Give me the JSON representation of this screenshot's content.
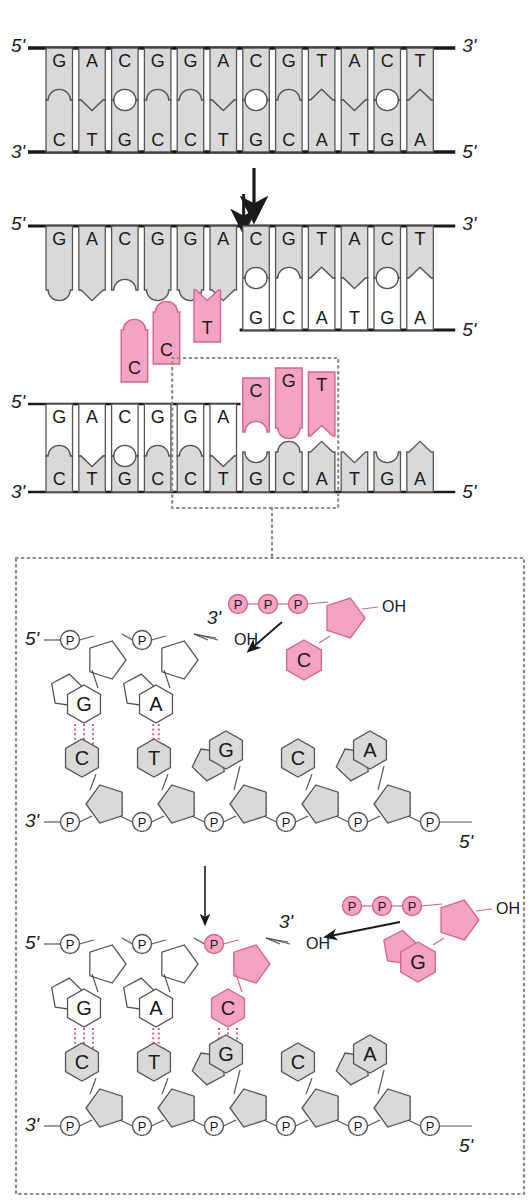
{
  "figure": {
    "colors": {
      "grey_fill": "#d9d9d9",
      "grey_stroke": "#555555",
      "pink_fill": "#f5a3c2",
      "pink_stroke": "#d4648f",
      "white_fill": "#ffffff",
      "line": "#1a1a1a",
      "hbond": "#e2578c"
    }
  },
  "panel1": {
    "name": "intact-double-helix",
    "end_labels": {
      "left_top": "5'",
      "right_top": "3'",
      "left_bottom": "3'",
      "right_bottom": "5'"
    },
    "top_strand": [
      "G",
      "A",
      "C",
      "G",
      "G",
      "A",
      "C",
      "G",
      "T",
      "A",
      "C",
      "T"
    ],
    "bottom_strand": [
      "C",
      "T",
      "G",
      "C",
      "C",
      "T",
      "G",
      "C",
      "A",
      "T",
      "G",
      "A"
    ]
  },
  "arrow1": {
    "name": "process-arrow-1",
    "direction": "down"
  },
  "panel2": {
    "name": "strands-separating",
    "end_labels": {
      "left_top": "5'",
      "right_top": "3'",
      "right_bottom": "5'"
    },
    "fork_arrow": {
      "name": "replication-fork-arrow",
      "direction": "down"
    },
    "top_strand": [
      "G",
      "A",
      "C",
      "G",
      "G",
      "A",
      "C",
      "G",
      "T",
      "A",
      "C",
      "T"
    ],
    "top_strand_open_count": 6,
    "bottom_strand_paired": [
      "G",
      "C",
      "A",
      "T",
      "G",
      "A"
    ],
    "free_nucleotides": [
      {
        "base": "C",
        "color": "pink"
      },
      {
        "base": "C",
        "color": "pink"
      },
      {
        "base": "T",
        "color": "pink"
      }
    ]
  },
  "panel3": {
    "name": "new-strand-elongating",
    "end_labels": {
      "left_top": "5'",
      "right_bottom": "5'",
      "left_bottom": "3'"
    },
    "top_strand": [
      "G",
      "A",
      "C",
      "G",
      "G",
      "A"
    ],
    "top_new_pink": [
      "C",
      "G",
      "T"
    ],
    "bottom_strand": [
      "C",
      "T",
      "G",
      "C",
      "C",
      "T",
      "G",
      "C",
      "A",
      "T",
      "G",
      "A"
    ],
    "callout_box": {
      "name": "zoom-callout-box",
      "style": "dotted"
    }
  },
  "detail_top": {
    "name": "detail-before-addition",
    "new_strand": {
      "end_label_5": "5'",
      "end_label_3": "3'",
      "phosphates": [
        "P",
        "P"
      ],
      "bases": [
        "G",
        "A"
      ],
      "terminus": "OH"
    },
    "incoming_nucleotide": {
      "name": "incoming-dctp",
      "triphosphate": [
        "P",
        "P",
        "P"
      ],
      "base": "C",
      "hydroxyl": "OH",
      "color": "pink"
    },
    "attack_arrow": {
      "name": "nucleophilic-attack-arrow"
    },
    "template_strand": {
      "end_label_3": "3'",
      "end_label_5": "5'",
      "phosphates": [
        "P",
        "P",
        "P",
        "P",
        "P",
        "P"
      ],
      "bases": [
        "C",
        "T",
        "G",
        "C",
        "A"
      ]
    },
    "hbonds": [
      {
        "pair": "G-C",
        "count": 3
      },
      {
        "pair": "A-T",
        "count": 2
      }
    ]
  },
  "arrow2": {
    "name": "process-arrow-2",
    "direction": "down"
  },
  "detail_bottom": {
    "name": "detail-after-addition",
    "new_strand": {
      "end_label_5": "5'",
      "end_label_3": "3'",
      "phosphates": [
        "P",
        "P"
      ],
      "phosphate_new": "P",
      "bases": [
        "G",
        "A"
      ],
      "base_new": "C",
      "terminus": "OH"
    },
    "incoming_nucleotide": {
      "name": "incoming-dgtp",
      "triphosphate": [
        "P",
        "P",
        "P"
      ],
      "base": "G",
      "hydroxyl": "OH",
      "color": "pink"
    },
    "attack_arrow": {
      "name": "nucleophilic-attack-arrow-2"
    },
    "template_strand": {
      "end_label_3": "3'",
      "end_label_5": "5'",
      "phosphates": [
        "P",
        "P",
        "P",
        "P",
        "P",
        "P"
      ],
      "bases": [
        "C",
        "T",
        "G",
        "C",
        "A"
      ]
    },
    "hbonds": [
      {
        "pair": "G-C",
        "count": 3
      },
      {
        "pair": "A-T",
        "count": 2
      },
      {
        "pair": "C-G",
        "count": 3
      }
    ]
  }
}
